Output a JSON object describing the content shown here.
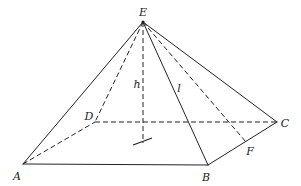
{
  "figure": {
    "type": "square pyramid",
    "stroke_color": "#222222",
    "vertices": {
      "A": {
        "label": "A",
        "x": 23,
        "y": 164,
        "lx": 17,
        "ly": 176
      },
      "B": {
        "label": "B",
        "x": 208,
        "y": 165,
        "lx": 206,
        "ly": 177
      },
      "C": {
        "label": "C",
        "x": 277,
        "y": 122,
        "lx": 285,
        "ly": 123
      },
      "D": {
        "label": "D",
        "x": 95,
        "y": 122,
        "lx": 89,
        "ly": 116
      },
      "E": {
        "label": "E",
        "x": 143,
        "y": 22,
        "lx": 143,
        "ly": 12
      },
      "F": {
        "label": "F",
        "x": 246,
        "y": 142,
        "lx": 250,
        "ly": 151
      }
    },
    "measures": {
      "h": {
        "label": "h",
        "lx": 137,
        "ly": 84
      },
      "l": {
        "label": "l",
        "lx": 179,
        "ly": 88
      }
    },
    "solid_edges": [
      "EA",
      "EB",
      "EC",
      "AB",
      "BC"
    ],
    "dashed_edges": [
      "ED",
      "EF",
      "AD",
      "DC",
      "E-foot"
    ]
  }
}
